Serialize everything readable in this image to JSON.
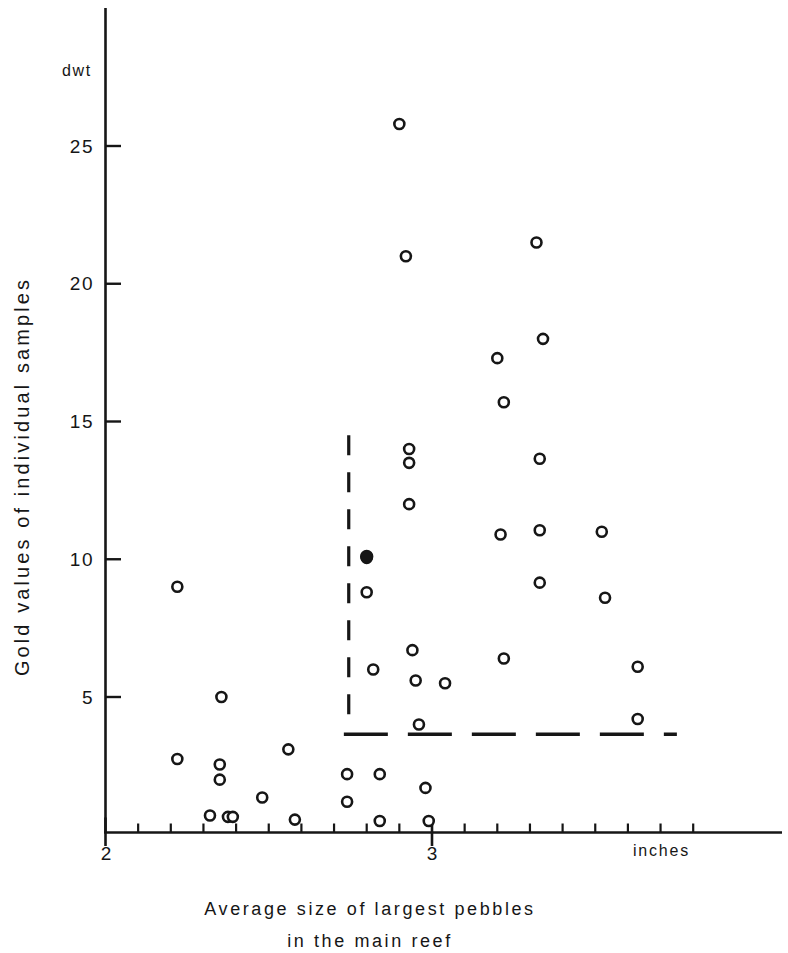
{
  "chart_data": {
    "type": "scatter",
    "title": "",
    "xlabel": "Average size of largest pebbles in the main reef",
    "xlabel_line1": "Average size of largest pebbles",
    "xlabel_line2": "in the main reef",
    "ylabel": "Gold values of individual samples",
    "x_unit": "inches",
    "y_unit": "dwt",
    "xlim": [
      2.0,
      3.85
    ],
    "ylim": [
      0,
      27.5
    ],
    "x_ticks_major": [
      2,
      3
    ],
    "x_tick_labels": [
      "2",
      "3"
    ],
    "x_minor_tick_step": 0.1,
    "y_ticks": [
      5,
      10,
      15,
      20,
      25
    ],
    "y_tick_labels": [
      "5",
      "10",
      "15",
      "20",
      "25"
    ],
    "grid": false,
    "legend": null,
    "series": [
      {
        "name": "individual samples",
        "marker": "open-circle",
        "points": [
          [
            2.22,
            9.0
          ],
          [
            2.22,
            2.75
          ],
          [
            2.32,
            0.7
          ],
          [
            2.355,
            5.0
          ],
          [
            2.35,
            2.55
          ],
          [
            2.35,
            2.0
          ],
          [
            2.375,
            0.65
          ],
          [
            2.39,
            0.65
          ],
          [
            2.48,
            1.35
          ],
          [
            2.56,
            3.1
          ],
          [
            2.58,
            0.55
          ],
          [
            2.74,
            2.2
          ],
          [
            2.74,
            1.2
          ],
          [
            2.8,
            10.05
          ],
          [
            2.8,
            8.8
          ],
          [
            2.82,
            6.0
          ],
          [
            2.84,
            2.2
          ],
          [
            2.84,
            0.5
          ],
          [
            2.9,
            25.8
          ],
          [
            2.92,
            21.0
          ],
          [
            2.93,
            14.0
          ],
          [
            2.93,
            13.5
          ],
          [
            2.93,
            12.0
          ],
          [
            2.94,
            6.7
          ],
          [
            2.95,
            5.6
          ],
          [
            2.96,
            4.0
          ],
          [
            2.98,
            1.7
          ],
          [
            2.99,
            0.5
          ],
          [
            3.04,
            5.5
          ],
          [
            3.2,
            17.3
          ],
          [
            3.22,
            15.7
          ],
          [
            3.21,
            10.9
          ],
          [
            3.22,
            6.4
          ],
          [
            3.32,
            21.5
          ],
          [
            3.34,
            18.0
          ],
          [
            3.33,
            13.65
          ],
          [
            3.33,
            11.05
          ],
          [
            3.33,
            9.15
          ],
          [
            3.52,
            11.0
          ],
          [
            3.53,
            8.6
          ],
          [
            3.63,
            6.1
          ],
          [
            3.63,
            4.2
          ]
        ]
      },
      {
        "name": "highlighted sample",
        "marker": "filled-circle",
        "points": [
          [
            2.8,
            10.1
          ]
        ]
      }
    ],
    "annotations": [
      {
        "name": "vertical-dashed-divider",
        "type": "vertical-dashed-line",
        "x": 2.745,
        "y_from": 3.9,
        "y_to": 14.5
      },
      {
        "name": "horizontal-dashed-mean-line",
        "type": "horizontal-dashed-line",
        "y": 3.65,
        "x_from": 2.73,
        "x_to": 3.75
      }
    ]
  },
  "labels": {
    "y_unit": "dwt",
    "x_unit": "inches",
    "ylabel": "Gold values of individual samples",
    "xlabel_line1": "Average size of largest pebbles",
    "xlabel_line2": "in the main reef",
    "ytick_25": "25",
    "ytick_20": "20",
    "ytick_15": "15",
    "ytick_10": "10",
    "ytick_5": "5",
    "xtick_2": "2",
    "xtick_3": "3"
  },
  "colors": {
    "ink": "#161616",
    "background": "#ffffff"
  }
}
